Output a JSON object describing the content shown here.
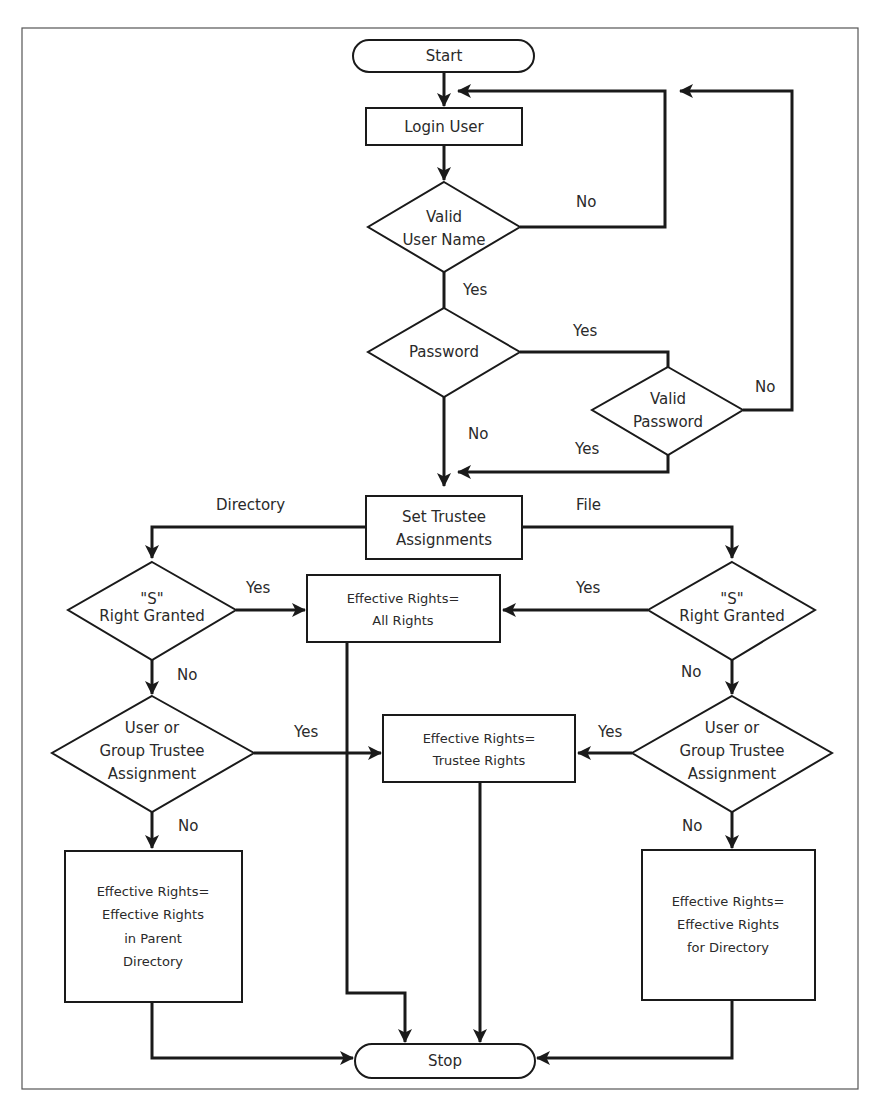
{
  "diagram": {
    "type": "flowchart",
    "colors": {
      "stroke": "#1a1a1a",
      "text": "#2a2a2a",
      "frame": "#555555",
      "background": "#ffffff"
    },
    "nodes": {
      "start": {
        "shape": "terminator",
        "lines": [
          "Start"
        ]
      },
      "login_user": {
        "shape": "process",
        "lines": [
          "Login User"
        ]
      },
      "valid_user_name": {
        "shape": "decision",
        "lines": [
          "Valid",
          "User Name"
        ]
      },
      "password": {
        "shape": "decision",
        "lines": [
          "Password"
        ]
      },
      "valid_password": {
        "shape": "decision",
        "lines": [
          "Valid",
          "Password"
        ]
      },
      "set_trustee": {
        "shape": "process",
        "lines": [
          "Set Trustee",
          "Assignments"
        ]
      },
      "s_right_dir": {
        "shape": "decision",
        "lines": [
          "\"S\"",
          "Right Granted"
        ]
      },
      "s_right_file": {
        "shape": "decision",
        "lines": [
          "\"S\"",
          "Right Granted"
        ]
      },
      "all_rights": {
        "shape": "process",
        "lines": [
          "Effective Rights=",
          "All Rights"
        ]
      },
      "group_dir": {
        "shape": "decision",
        "lines": [
          "User or",
          "Group Trustee",
          "Assignment"
        ]
      },
      "group_file": {
        "shape": "decision",
        "lines": [
          "User or",
          "Group Trustee",
          "Assignment"
        ]
      },
      "trustee_rights": {
        "shape": "process",
        "lines": [
          "Effective Rights=",
          "Trustee Rights"
        ]
      },
      "parent_dir": {
        "shape": "process",
        "lines": [
          "Effective Rights=",
          "Effective Rights",
          "in Parent",
          "Directory"
        ]
      },
      "for_dir": {
        "shape": "process",
        "lines": [
          "Effective Rights=",
          "Effective Rights",
          "for Directory"
        ]
      },
      "stop": {
        "shape": "terminator",
        "lines": [
          "Stop"
        ]
      }
    },
    "edge_labels": {
      "vun_no": "No",
      "vun_yes": "Yes",
      "pw_yes": "Yes",
      "pw_no": "No",
      "vpw_no": "No",
      "vpw_yes": "Yes",
      "dir": "Directory",
      "file": "File",
      "sdir_yes": "Yes",
      "sdir_no": "No",
      "sfile_yes": "Yes",
      "sfile_no": "No",
      "gdir_yes": "Yes",
      "gdir_no": "No",
      "gfile_yes": "Yes",
      "gfile_no": "No"
    },
    "edges": [
      {
        "from": "start",
        "to": "login_user"
      },
      {
        "from": "login_user",
        "to": "valid_user_name"
      },
      {
        "from": "valid_user_name",
        "to": "login_user",
        "label": "No"
      },
      {
        "from": "valid_user_name",
        "to": "password",
        "label": "Yes"
      },
      {
        "from": "password",
        "to": "valid_password",
        "label": "Yes"
      },
      {
        "from": "password",
        "to": "set_trustee",
        "label": "No"
      },
      {
        "from": "valid_password",
        "to": "login_user",
        "label": "No"
      },
      {
        "from": "valid_password",
        "to": "set_trustee",
        "label": "Yes"
      },
      {
        "from": "set_trustee",
        "to": "s_right_dir",
        "label": "Directory"
      },
      {
        "from": "set_trustee",
        "to": "s_right_file",
        "label": "File"
      },
      {
        "from": "s_right_dir",
        "to": "all_rights",
        "label": "Yes"
      },
      {
        "from": "s_right_dir",
        "to": "group_dir",
        "label": "No"
      },
      {
        "from": "s_right_file",
        "to": "all_rights",
        "label": "Yes"
      },
      {
        "from": "s_right_file",
        "to": "group_file",
        "label": "No"
      },
      {
        "from": "group_dir",
        "to": "trustee_rights",
        "label": "Yes"
      },
      {
        "from": "group_dir",
        "to": "parent_dir",
        "label": "No"
      },
      {
        "from": "group_file",
        "to": "trustee_rights",
        "label": "Yes"
      },
      {
        "from": "group_file",
        "to": "for_dir",
        "label": "No"
      },
      {
        "from": "all_rights",
        "to": "stop"
      },
      {
        "from": "trustee_rights",
        "to": "stop"
      },
      {
        "from": "parent_dir",
        "to": "stop"
      },
      {
        "from": "for_dir",
        "to": "stop"
      }
    ]
  }
}
